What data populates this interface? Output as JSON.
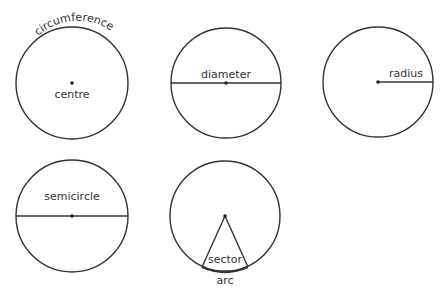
{
  "diagrams": [
    {
      "id": "circumference-circle",
      "labels": {
        "curved": "circumference",
        "center": "centre"
      }
    },
    {
      "id": "diameter-circle",
      "labels": {
        "line": "diameter"
      }
    },
    {
      "id": "radius-circle",
      "labels": {
        "line": "radius"
      }
    },
    {
      "id": "semicircle-circle",
      "labels": {
        "region": "semicircle"
      }
    },
    {
      "id": "sector-circle",
      "labels": {
        "region": "sector",
        "arc": "arc"
      }
    }
  ],
  "colors": {
    "stroke": "#333333",
    "text": "#333333",
    "background": "#ffffff"
  }
}
